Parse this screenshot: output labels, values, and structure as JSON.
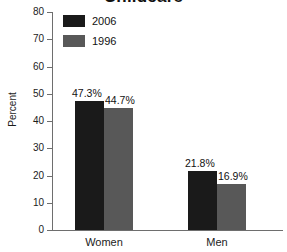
{
  "chart_data": {
    "type": "bar",
    "title": "Childcare",
    "xlabel": "",
    "ylabel": "Percent",
    "ylim": [
      0,
      80
    ],
    "yticks": [
      0,
      10,
      20,
      30,
      40,
      50,
      60,
      70,
      80
    ],
    "ytick_labels": [
      "0",
      "10",
      "20",
      "30",
      "40",
      "50",
      "60",
      "70",
      "80"
    ],
    "grid": false,
    "legend_position": "top-left",
    "categories": [
      "Women",
      "Men"
    ],
    "series": [
      {
        "name": "2006",
        "color": "#1a1a1a",
        "values": [
          47.3,
          21.8
        ],
        "value_labels": [
          "47.3%",
          "21.8%"
        ]
      },
      {
        "name": "1996",
        "color": "#585858",
        "values": [
          44.7,
          16.9
        ],
        "value_labels": [
          "44.7%",
          "16.9%"
        ]
      }
    ]
  },
  "axis": {
    "color": "#6e6e6e"
  }
}
